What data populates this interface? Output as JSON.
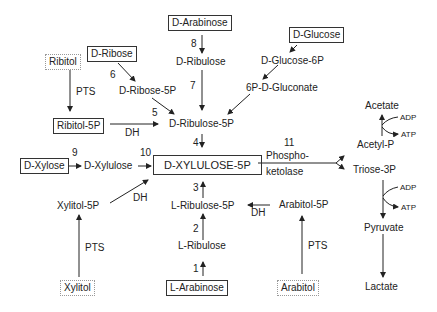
{
  "diagram": {
    "type": "metabolic-pathway",
    "central_node": "D-XYLULOSE-5P",
    "nodes": {
      "d_arabinose": "D-Arabinose",
      "d_ribulose": "D-Ribulose",
      "d_glucose": "D-Glucose",
      "d_glucose_6p": "D-Glucose-6P",
      "gluconate_6p": "6P-D-Gluconate",
      "ribitol": "Ribitol",
      "d_ribose": "D-Ribose",
      "d_ribose_5p": "D-Ribose-5P",
      "ribitol_5p": "Ribitol-5P",
      "d_ribulose_5p": "D-Ribulose-5P",
      "d_xylose": "D-Xylose",
      "d_xylulose": "D-Xylulose",
      "d_xylulose_5p": "D-XYLULOSE-5P",
      "xylitol_5p": "Xylitol-5P",
      "l_ribulose_5p": "L-Ribulose-5P",
      "l_ribulose": "L-Ribulose",
      "arabitol_5p": "Arabitol-5P",
      "xylitol": "Xylitol",
      "l_arabinose": "L-Arabinose",
      "arabitol": "Arabitol",
      "acetate": "Acetate",
      "acetyl_p": "Acetyl-P",
      "triose_3p": "Triose-3P",
      "pyruvate": "Pyruvate",
      "lactate": "Lactate"
    },
    "edge_labels": {
      "pts_ribitol": "PTS",
      "dh_ribitol": "DH",
      "dh_xylitol": "DH",
      "pts_xylitol": "PTS",
      "dh_arabitol": "DH",
      "pts_arabitol": "PTS",
      "phosphoketolase_1": "Phospho-",
      "phosphoketolase_2": "ketolase",
      "adp_1": "ADP",
      "atp_1": "ATP",
      "adp_2": "ADP",
      "atp_2": "ATP"
    },
    "step_numbers": {
      "s1": "1",
      "s2": "2",
      "s3": "3",
      "s4": "4",
      "s5": "5",
      "s6": "6",
      "s7": "7",
      "s8": "8",
      "s9": "9",
      "s10": "10",
      "s11": "11"
    },
    "legend": {
      "solid_box": "substrate (sugar)",
      "dotted_box": "polyol substrate"
    }
  }
}
